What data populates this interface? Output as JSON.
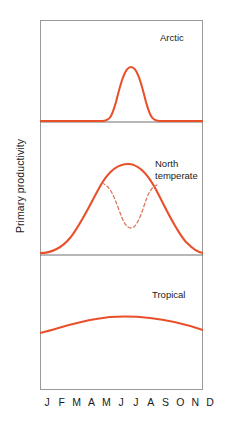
{
  "figure": {
    "ylabel": "Primary productivity",
    "accent_color": "#E8502A",
    "frame_color": "#9a9a9a",
    "text_color": "#1a1a1a",
    "background_color": "#ffffff"
  },
  "axis": {
    "x_tick_labels": [
      "J",
      "F",
      "M",
      "A",
      "M",
      "J",
      "J",
      "A",
      "S",
      "O",
      "N",
      "D"
    ]
  },
  "panels": {
    "arctic": {
      "label": "Arctic"
    },
    "north_temperate": {
      "label": "North\ntemperate"
    },
    "tropical": {
      "label": "Tropical"
    }
  },
  "chart_data": {
    "type": "line",
    "title": "",
    "xlabel": "",
    "ylabel": "Primary productivity",
    "x": [
      "J",
      "F",
      "M",
      "A",
      "M",
      "J",
      "J",
      "A",
      "S",
      "O",
      "N",
      "D"
    ],
    "grid": false,
    "legend": "none",
    "panel_layout": "3 stacked panels sharing one x axis (months J-D)",
    "axis_ticks_numeric": false,
    "panels": [
      {
        "name": "Arctic",
        "label": "Arctic",
        "ylim": [
          0,
          1
        ],
        "series": [
          {
            "name": "Arctic primary productivity",
            "style": "solid",
            "color": "#E8502A",
            "values": [
              0.0,
              0.0,
              0.0,
              0.02,
              0.12,
              0.62,
              0.88,
              0.45,
              0.06,
              0.0,
              0.0,
              0.0
            ],
            "description": "flat near zero most of year with a single narrow sharp summer peak around June-July"
          }
        ]
      },
      {
        "name": "North temperate",
        "label": "North\ntemperate",
        "ylim": [
          0,
          1
        ],
        "series": [
          {
            "name": "North temperate primary productivity",
            "style": "solid",
            "color": "#E8502A",
            "values": [
              0.02,
              0.05,
              0.16,
              0.38,
              0.64,
              0.84,
              0.88,
              0.78,
              0.55,
              0.3,
              0.11,
              0.02
            ],
            "description": "broad single-humped curve peaking in mid summer"
          },
          {
            "name": "North temperate with summer nutrient depletion",
            "style": "dashed",
            "color": "#D8785E",
            "values": [
              null,
              null,
              null,
              null,
              0.64,
              0.47,
              0.24,
              0.5,
              0.55,
              null,
              null,
              null
            ],
            "description": "dashed bimodal variant: spring bloom, midsummer dip, then autumn bloom"
          }
        ]
      },
      {
        "name": "Tropical",
        "label": "Tropical",
        "ylim": [
          0,
          1
        ],
        "series": [
          {
            "name": "Tropical primary productivity",
            "style": "solid",
            "color": "#E8502A",
            "values": [
              0.26,
              0.3,
              0.34,
              0.37,
              0.39,
              0.4,
              0.4,
              0.39,
              0.37,
              0.34,
              0.31,
              0.29
            ],
            "description": "nearly flat low gentle arch, slightly higher mid year"
          }
        ]
      }
    ]
  }
}
